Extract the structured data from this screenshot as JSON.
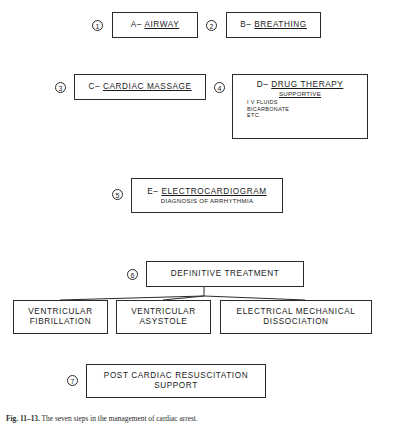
{
  "figure": {
    "caption_label": "Fig. 11–13.",
    "caption_text": "The seven steps in the management of cardiac arrest."
  },
  "steps": [
    {
      "number": "1",
      "title_prefix": "A– ",
      "title_underlined": "AIRWAY",
      "sub": "",
      "details": []
    },
    {
      "number": "2",
      "title_prefix": "B– ",
      "title_underlined": "BREATHING",
      "sub": "",
      "details": []
    },
    {
      "number": "3",
      "title_prefix": "C– ",
      "title_underlined": "CARDIAC MASSAGE",
      "sub": "",
      "details": []
    },
    {
      "number": "4",
      "title_prefix": "D– ",
      "title_underlined": "DRUG THERAPY",
      "sub": "SUPPORTIVE",
      "details": [
        "I V FLUIDS",
        "BICARBONATE",
        "ETC."
      ]
    },
    {
      "number": "5",
      "title_prefix": "E– ",
      "title_underlined": "ELECTROCARDIOGRAM",
      "sub": "DIAGNOSIS OF ARRHYTHMIA",
      "details": []
    },
    {
      "number": "6",
      "title_prefix": "",
      "title_underlined": "",
      "title_plain": "DEFINITIVE TREATMENT",
      "sub": "",
      "details": []
    },
    {
      "number": "7",
      "title_prefix": "",
      "title_underlined": "",
      "title_plain": "POST CARDIAC RESUSCITATION",
      "sub": "SUPPORT",
      "details": []
    }
  ],
  "outcomes": [
    {
      "line_a": "VENTRICULAR",
      "line_b": "FIBRILLATION"
    },
    {
      "line_a": "VENTRICULAR",
      "line_b": "ASYSTOLE"
    },
    {
      "line_a": "ELECTRICAL MECHANICAL",
      "line_b": "DISSOCIATION"
    }
  ],
  "colors": {
    "ink": "#2a2a2a",
    "paper": "#ffffff"
  }
}
